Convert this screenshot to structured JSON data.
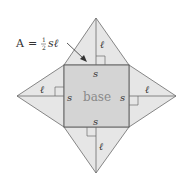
{
  "diagram": {
    "formula": {
      "lhs": "A",
      "equals": "=",
      "frac_num": "1",
      "frac_den": "2",
      "rhs": "sℓ"
    },
    "base_label": "base",
    "side_label": "s",
    "slant_label": "ℓ",
    "faces": [
      "top",
      "right",
      "bottom",
      "left"
    ],
    "colors": {
      "face_fill": "#e6e6e6",
      "base_fill": "#d4d4d4",
      "stroke": "#6a6a6a",
      "text": "#333333",
      "base_text": "#8a8a8a"
    }
  }
}
